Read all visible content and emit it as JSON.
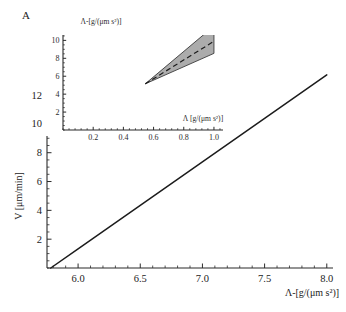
{
  "panel": {
    "label": "A"
  },
  "chart_data": [
    {
      "id": "main-plot",
      "type": "line",
      "title": "",
      "xlabel": "Λ-[g/(μm s²)]",
      "ylabel": "V [μm/min]",
      "xlim": [
        5.75,
        8.05
      ],
      "ylim": [
        0,
        13.6
      ],
      "xticks": [
        6.0,
        6.5,
        7.0,
        7.5,
        8.0
      ],
      "xticklabels": [
        "6.0",
        "6.5",
        "7.0",
        "7.5",
        "8.0"
      ],
      "yticks": [
        2,
        4,
        6,
        8,
        10,
        12
      ],
      "yticklabels": [
        "2",
        "4",
        "6",
        "8",
        "10",
        "12"
      ],
      "grid": false,
      "legend": "none",
      "series": [
        {
          "name": "velocity",
          "color": "#1c1c1c",
          "style": "solid",
          "x": [
            5.78,
            6.0,
            6.5,
            7.0,
            7.5,
            8.0
          ],
          "y": [
            0.0,
            1.33,
            4.34,
            7.36,
            10.38,
            13.4
          ]
        }
      ]
    },
    {
      "id": "inset-plot",
      "type": "area",
      "title": "",
      "xlabel": "Λ [g/(μm s²)]",
      "ylabel": "Λ-[g/(μm s²)]",
      "xlim": [
        0,
        1.06
      ],
      "ylim": [
        0,
        10.6
      ],
      "xticks": [
        0.2,
        0.4,
        0.6,
        0.8,
        1.0
      ],
      "xticklabels": [
        "0.2",
        "0.4",
        "0.6",
        "0.8",
        "1.0"
      ],
      "yticks": [
        2,
        4,
        6,
        8,
        10
      ],
      "yticklabels": [
        "2",
        "4",
        "6",
        "8",
        "10"
      ],
      "grid": false,
      "legend": "none",
      "band": {
        "name": "uncertainty-wedge",
        "fill": "#9d9d9d",
        "apex_x": 0.545,
        "apex_y": 5.15,
        "upper": {
          "x": [
            0.545,
            1.0
          ],
          "y": [
            5.15,
            11.6
          ]
        },
        "lower": {
          "x": [
            0.545,
            1.0
          ],
          "y": [
            5.15,
            8.55
          ]
        }
      },
      "series": [
        {
          "name": "mean-line",
          "color": "#1c1c1c",
          "style": "dashed",
          "x": [
            0.545,
            1.0
          ],
          "y": [
            5.15,
            9.9
          ]
        }
      ]
    }
  ]
}
